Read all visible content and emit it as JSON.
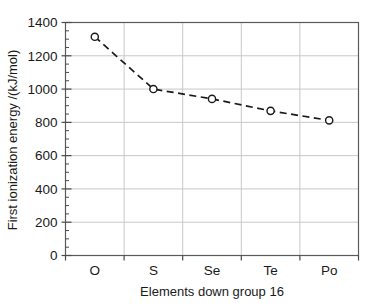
{
  "chart_data": {
    "type": "line",
    "title": "",
    "xlabel": "Elements down group 16",
    "ylabel": "First ionization energy /(kJ/mol)",
    "categories": [
      "O",
      "S",
      "Se",
      "Te",
      "Po"
    ],
    "values": [
      1314,
      1000,
      941,
      869,
      812
    ],
    "series": [
      {
        "name": "First ionization energy",
        "values": [
          1314,
          1000,
          941,
          869,
          812
        ]
      }
    ],
    "ylim": [
      0,
      1400
    ],
    "ytick_labels": [
      "0",
      "200",
      "400",
      "600",
      "800",
      "1000",
      "1200",
      "1400"
    ],
    "ytick_values": [
      0,
      200,
      400,
      600,
      800,
      1000,
      1200,
      1400
    ],
    "y_minor_step": 50,
    "xtick_labels": [
      "O",
      "S",
      "Se",
      "Te",
      "Po"
    ],
    "grid": "both",
    "legend": "none",
    "line_style": "dashed",
    "marker": "open-circle",
    "colors": {
      "line": "#1a1a1a",
      "marker_edge": "#1a1a1a",
      "marker_face": "#ffffff",
      "grid": "#c8c8c8",
      "axis": "#4a4a4a",
      "background": "#ffffff",
      "text": "#1a1a1a"
    }
  }
}
